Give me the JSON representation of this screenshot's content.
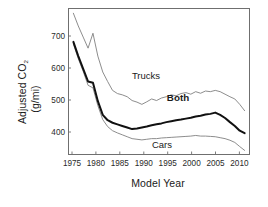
{
  "chart_data": {
    "type": "line",
    "title": "",
    "xlabel": "Model Year",
    "ylabel_line1": "Adjusted CO",
    "ylabel_sub": "2",
    "ylabel_line2": "(g/mi)",
    "ylabel_full": "Adjusted CO2 (g/mi)",
    "xlim": [
      1974,
      2011
    ],
    "ylim": [
      330,
      790
    ],
    "xticks": [
      1975,
      1980,
      1985,
      1990,
      1995,
      2000,
      2005,
      2010
    ],
    "yticks": [
      400,
      500,
      600,
      700
    ],
    "grid": false,
    "legend": "inline-annotations",
    "annotations": [
      {
        "text": "Trucks",
        "x": 1992,
        "y": 545
      },
      {
        "text": "Both",
        "x": 2000,
        "y": 480
      },
      {
        "text": "Cars",
        "x": 1996,
        "y": 360
      }
    ],
    "x": [
      1975,
      1976,
      1977,
      1978,
      1979,
      1980,
      1981,
      1982,
      1983,
      1984,
      1985,
      1986,
      1987,
      1988,
      1989,
      1990,
      1991,
      1992,
      1993,
      1994,
      1995,
      1996,
      1997,
      1998,
      1999,
      2000,
      2001,
      2002,
      2003,
      2004,
      2005,
      2006,
      2007,
      2008,
      2009,
      2010
    ],
    "series": [
      {
        "name": "Trucks",
        "style": "thin",
        "values": [
          775,
          735,
          700,
          665,
          712,
          640,
          590,
          560,
          532,
          522,
          518,
          512,
          500,
          495,
          488,
          496,
          505,
          500,
          508,
          512,
          518,
          515,
          522,
          525,
          520,
          528,
          523,
          530,
          528,
          532,
          528,
          520,
          512,
          505,
          488,
          468
        ]
      },
      {
        "name": "Both",
        "style": "bold",
        "values": [
          685,
          640,
          600,
          560,
          556,
          498,
          455,
          438,
          430,
          425,
          420,
          415,
          410,
          412,
          415,
          418,
          422,
          425,
          428,
          432,
          435,
          438,
          440,
          443,
          446,
          450,
          452,
          456,
          458,
          462,
          455,
          445,
          432,
          420,
          405,
          397
        ]
      },
      {
        "name": "Cars",
        "style": "thin",
        "values": [
          678,
          632,
          592,
          548,
          540,
          484,
          440,
          418,
          405,
          398,
          392,
          386,
          380,
          378,
          376,
          378,
          380,
          380,
          382,
          383,
          384,
          385,
          386,
          387,
          388,
          390,
          388,
          388,
          387,
          386,
          383,
          380,
          375,
          368,
          355,
          343
        ]
      }
    ]
  },
  "axes": {
    "x_tick_labels": [
      "1975",
      "1980",
      "1985",
      "1990",
      "1995",
      "2000",
      "2005",
      "2010"
    ],
    "y_tick_labels": [
      "400",
      "500",
      "600",
      "700"
    ]
  }
}
